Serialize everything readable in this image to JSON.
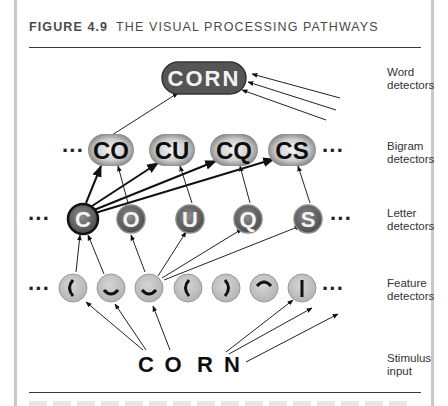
{
  "figure": {
    "number": "FIGURE 4.9",
    "title": "THE VISUAL PROCESSING PATHWAYS"
  },
  "layers": [
    {
      "id": "word",
      "label": "Word\ndetectors"
    },
    {
      "id": "bigram",
      "label": "Bigram\ndetectors"
    },
    {
      "id": "letter",
      "label": "Letter\ndetectors"
    },
    {
      "id": "feature",
      "label": "Feature\ndetectors"
    },
    {
      "id": "stimulus",
      "label": "Stimulus\ninput"
    }
  ],
  "word_detectors": [
    {
      "text": "CORN",
      "x": 202,
      "y": 78
    }
  ],
  "bigram_detectors": [
    {
      "text": "CO",
      "x": 110,
      "y": 150
    },
    {
      "text": "CU",
      "x": 172,
      "y": 150
    },
    {
      "text": "CQ",
      "x": 234,
      "y": 150
    },
    {
      "text": "CS",
      "x": 292,
      "y": 150
    }
  ],
  "letter_detectors": [
    {
      "text": "C",
      "x": 82,
      "y": 218,
      "active": true
    },
    {
      "text": "O",
      "x": 130,
      "y": 218,
      "active": false
    },
    {
      "text": "U",
      "x": 190,
      "y": 218,
      "active": false
    },
    {
      "text": "Q",
      "x": 248,
      "y": 218,
      "active": false
    },
    {
      "text": "S",
      "x": 308,
      "y": 218,
      "active": false
    }
  ],
  "feature_detectors": [
    {
      "glyph": "left-curve",
      "x": 73,
      "y": 288
    },
    {
      "glyph": "bottom-curve",
      "x": 111,
      "y": 288
    },
    {
      "glyph": "bottom-curve",
      "x": 149,
      "y": 288
    },
    {
      "glyph": "left-curve",
      "x": 188,
      "y": 288
    },
    {
      "glyph": "right-curve",
      "x": 226,
      "y": 288
    },
    {
      "glyph": "top-curve",
      "x": 264,
      "y": 288
    },
    {
      "glyph": "vertical-line",
      "x": 302,
      "y": 288
    }
  ],
  "stimulus": [
    {
      "text": "C",
      "x": 145,
      "y": 362
    },
    {
      "text": "O",
      "x": 172,
      "y": 362
    },
    {
      "text": "R",
      "x": 205,
      "y": 362
    },
    {
      "text": "N",
      "x": 232,
      "y": 362
    }
  ],
  "ellipsis": "···",
  "colors": {
    "node_dark": "#5b5b5b",
    "node_gray": "#8a8a8a",
    "feature_fill": "#c8c8c8",
    "ink": "#111111",
    "label": "#333333"
  }
}
